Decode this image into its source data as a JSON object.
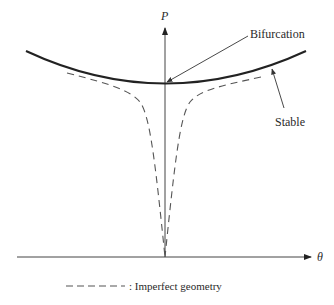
{
  "diagram": {
    "type": "bifurcation-diagram",
    "axes": {
      "y_label": "P",
      "x_label": "θ"
    },
    "annotations": {
      "bifurcation": "Bifurcation",
      "stable": "Stable"
    },
    "legend": {
      "dashed_label": ": Imperfect geometry"
    },
    "curves": [
      {
        "name": "stable-path",
        "style": "solid",
        "description": "Perfect geometry post-buckling path (stable, rising on both sides)"
      },
      {
        "name": "imperfect-left",
        "style": "dashed",
        "description": "Imperfect geometry path, negative θ"
      },
      {
        "name": "imperfect-right",
        "style": "dashed",
        "description": "Imperfect geometry path, positive θ"
      }
    ],
    "colors": {
      "line": "#222222",
      "dashed": "#555555",
      "background": "#ffffff"
    }
  }
}
